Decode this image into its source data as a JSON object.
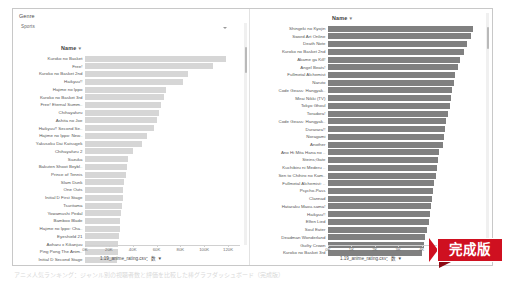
{
  "window": {
    "filter": {
      "label": "Genre",
      "value": "Sports",
      "caret_icon": "chevron-down-icon"
    },
    "caption": "アニメ人気ランキング：ジャンル別の視聴者数と評価を比較した棒グラフダッシュボード（完成版）"
  },
  "chart_data": [
    {
      "id": "left",
      "type": "bar",
      "orientation": "horizontal",
      "title": "Name",
      "sort_glyph": "▼",
      "xlabel": "1.19_anime_rating.csv：数 ▼",
      "ylabel": "",
      "xlim": [
        0,
        130000
      ],
      "tick_labels": [
        "0K",
        "20K",
        "40K",
        "60K",
        "80K",
        "100K",
        "120K"
      ],
      "tick_values": [
        0,
        20000,
        40000,
        60000,
        80000,
        100000,
        120000
      ],
      "grid": false,
      "legend": "none",
      "bar_color": "#d6d6d6",
      "categories": [
        "Kuroko no Basket",
        "Free!",
        "Kuroko no Basket 2nd",
        "Haikyuu!!",
        "Hajime no Ippo",
        "Kuroko no Basket 3rd",
        "Free! Eternal Summ..",
        "Chihayafuru",
        "Ashita no Joe",
        "Haikyuu!! Second Se..",
        "Hajime no Ippo: New..",
        "Yakusoku Dai Katsugek",
        "Chihayafuru 2",
        "Suzuka",
        "Bakuten Shoot Beybl..",
        "Prince of Tennis",
        "Slam Dunk",
        "One Outs",
        "Initial D First Stage",
        "Tsuritama",
        "Yowamushi Pedal",
        "Bamboo Blade",
        "Hajime no Ippo: Cha..",
        "Eyeshield 21",
        "Aoharu x Kikanjuu",
        "Ping Pong The Anim..",
        "Initial D Second Stage"
      ],
      "values": [
        118000,
        107000,
        86000,
        82000,
        68000,
        66000,
        64000,
        62000,
        60000,
        58000,
        52000,
        48000,
        40000,
        36000,
        35000,
        34000,
        33000,
        32000,
        31500,
        31000,
        30000,
        29500,
        29000,
        28500,
        28000,
        27500,
        27000
      ]
    },
    {
      "id": "right",
      "type": "bar",
      "orientation": "horizontal",
      "title": "Name",
      "sort_glyph": "▼",
      "xlabel": "1.19_anime_rating.csv：数 ▼",
      "ylabel": "",
      "xlim": [
        0,
        65000
      ],
      "tick_labels": [
        "0K",
        "1K",
        "2K",
        "3K",
        "4K",
        "5K",
        "6K"
      ],
      "tick_values": [
        0,
        10000,
        20000,
        30000,
        40000,
        50000,
        60000
      ],
      "grid": false,
      "legend": "none",
      "bar_color": "#808080",
      "categories": [
        "Shingeki no Kyojin",
        "Sword Art Online",
        "Death Note",
        "Kuroko no Basket 2nd",
        "Akame ga Kill!",
        "Angel Beats!",
        "Fullmetal Alchemist",
        "Naruto",
        "Code Geass: Hangyak..",
        "Mirai Nikki (TV)",
        "Tokyo Ghoul",
        "Toradora!",
        "Code Geass: Hangyak..",
        "Durarara!!",
        "Noragami",
        "Another",
        "Ano Hi Mita Hana no ..",
        "Steins;Gate",
        "Kuchibiru ni Mederu ..",
        "Sen to Chihiro no Kam..",
        "Fullmetal Alchemist: ..",
        "Psycho-Pass",
        "Clannad",
        "Hataraku Maou-sama!",
        "Haikyuu!!",
        "Elfen Lied",
        "Soul Eater",
        "Deadman Wonderland",
        "Guilty Crown",
        "Kuroko no Basket 3rd"
      ],
      "values": [
        62000,
        61000,
        59500,
        58000,
        56500,
        55500,
        54500,
        54000,
        53000,
        52500,
        52000,
        51500,
        50500,
        50000,
        49500,
        49000,
        47500,
        47000,
        46500,
        46000,
        45500,
        45000,
        44500,
        44000,
        43500,
        43000,
        42500,
        41500,
        41000,
        40000
      ]
    }
  ],
  "badge": {
    "text": "完成版"
  },
  "scrollbars": {
    "left_pane": "vertical-scrollbar",
    "right_pane": "vertical-scrollbar"
  }
}
